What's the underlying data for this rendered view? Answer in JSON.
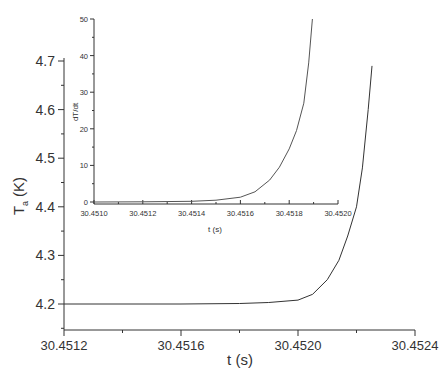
{
  "chart_data": [
    {
      "id": "main",
      "type": "line",
      "title": "",
      "xlabel": "t (s)",
      "ylabel": "T_a (K)",
      "ylabel_main": "T",
      "ylabel_sub": "a",
      "ylabel_unit": "(K)",
      "xlim": [
        30.4512,
        30.4524
      ],
      "ylim": [
        4.15,
        4.7
      ],
      "xticks": [
        "30.4512",
        "30.4516",
        "30.4520",
        "30.4524"
      ],
      "yticks": [
        "4.2",
        "4.3",
        "4.4",
        "4.5",
        "4.6",
        "4.7"
      ],
      "grid": false,
      "series": [
        {
          "name": "T_a",
          "x": [
            30.4512,
            30.4516,
            30.4518,
            30.4519,
            30.452,
            30.45205,
            30.4521,
            30.45214,
            30.45217,
            30.4522,
            30.45222,
            30.45224,
            30.452253
          ],
          "y": [
            4.2,
            4.2,
            4.201,
            4.203,
            4.208,
            4.22,
            4.25,
            4.29,
            4.34,
            4.4,
            4.48,
            4.6,
            4.69
          ]
        }
      ]
    },
    {
      "id": "inset",
      "type": "line",
      "title": "",
      "xlabel": "t (s)",
      "ylabel": "dT/dt",
      "xlim": [
        30.451,
        30.452
      ],
      "ylim": [
        -1,
        50
      ],
      "xticks": [
        "30.4510",
        "30.4512",
        "30.4514",
        "30.4516",
        "30.4518",
        "30.4520"
      ],
      "yticks": [
        "0",
        "10",
        "20",
        "30",
        "40",
        "50"
      ],
      "grid": false,
      "series": [
        {
          "name": "dT/dt",
          "x": [
            30.451,
            30.4512,
            30.4514,
            30.4515,
            30.4516,
            30.45166,
            30.45172,
            30.45176,
            30.4518,
            30.45183,
            30.45186,
            30.45188,
            30.451895
          ],
          "y": [
            0.0,
            0.05,
            0.2,
            0.5,
            1.3,
            2.8,
            6.0,
            9.5,
            14.5,
            19.5,
            27.0,
            38.0,
            50.0
          ]
        }
      ]
    }
  ]
}
